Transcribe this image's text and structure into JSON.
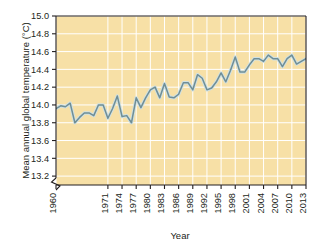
{
  "chart_data": {
    "type": "line",
    "title": "",
    "xlabel": "Year",
    "ylabel": "Mean annual global temperature (°C)",
    "xlim": [
      1960,
      2013
    ],
    "ylim": [
      13.1,
      15.0
    ],
    "y_axis_break": true,
    "grid": true,
    "legend": null,
    "plot_background": "#f7e0a6",
    "gridline_color": "#ffffff",
    "line_color": "#6f8e96",
    "line_outline_color": "#cfe0e2",
    "yticks": [
      "15.0",
      "14.8",
      "14.6",
      "14.4",
      "14.2",
      "14.0",
      "13.8",
      "13.6",
      "13.4",
      "13.2"
    ],
    "ytick_values": [
      15.0,
      14.8,
      14.6,
      14.4,
      14.2,
      14.0,
      13.8,
      13.6,
      13.4,
      13.2
    ],
    "xticks": [
      "1960",
      "1971",
      "1974",
      "1977",
      "1980",
      "1983",
      "1986",
      "1989",
      "1992",
      "1995",
      "1998",
      "2001",
      "2004",
      "2007",
      "2010",
      "2013"
    ],
    "xtick_values": [
      1960,
      1971,
      1974,
      1977,
      1980,
      1983,
      1986,
      1989,
      1992,
      1995,
      1998,
      2001,
      2004,
      2007,
      2010,
      2013
    ],
    "x": [
      1960,
      1961,
      1962,
      1963,
      1964,
      1965,
      1966,
      1967,
      1968,
      1969,
      1970,
      1971,
      1972,
      1973,
      1974,
      1975,
      1976,
      1977,
      1978,
      1979,
      1980,
      1981,
      1982,
      1983,
      1984,
      1985,
      1986,
      1987,
      1988,
      1989,
      1990,
      1991,
      1992,
      1993,
      1994,
      1995,
      1996,
      1997,
      1998,
      1999,
      2000,
      2001,
      2002,
      2003,
      2004,
      2005,
      2006,
      2007,
      2008,
      2009,
      2010,
      2011,
      2012,
      2013
    ],
    "values": [
      13.96,
      13.99,
      13.98,
      14.02,
      13.8,
      13.86,
      13.91,
      13.91,
      13.88,
      14.0,
      14.0,
      13.85,
      13.96,
      14.1,
      13.87,
      13.88,
      13.8,
      14.08,
      13.97,
      14.08,
      14.17,
      14.2,
      14.08,
      14.24,
      14.09,
      14.08,
      14.12,
      14.25,
      14.25,
      14.17,
      14.34,
      14.3,
      14.17,
      14.19,
      14.26,
      14.36,
      14.26,
      14.39,
      14.54,
      14.37,
      14.37,
      14.45,
      14.52,
      14.52,
      14.49,
      14.56,
      14.52,
      14.52,
      14.43,
      14.52,
      14.56,
      14.46,
      14.49,
      14.52
    ]
  }
}
